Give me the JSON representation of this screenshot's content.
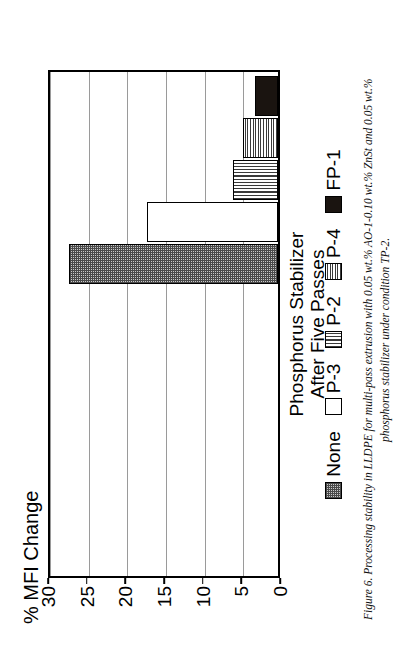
{
  "figure": {
    "caption_line1": "Figure 6.  Processing stability in  LLDPE  for  multi-pass extrusion  with  0.05  wt.%  AO-1-0.10  wt.%  ZnSt  and  0.05  wt.%",
    "caption_line2": "phosphorus stabilizer under condition TP-2."
  },
  "chart_data": {
    "type": "bar",
    "orientation": "vertical",
    "title": "",
    "xlabel": "Phosphorus Stabilizer After Five Passes",
    "ylabel": "% MFI Change",
    "categories": [
      "None",
      "P-3",
      "P-2",
      "P-4",
      "FP-1"
    ],
    "values": [
      27,
      17,
      5.8,
      4.5,
      3
    ],
    "ylim": [
      0,
      30
    ],
    "yticks": [
      0,
      5,
      10,
      15,
      20,
      25,
      30
    ],
    "ytick_labels": [
      "0",
      "5",
      "10",
      "15",
      "20",
      "25",
      "30"
    ],
    "grid": true,
    "grid_axis": "y",
    "legend_position": "bottom",
    "series": [
      {
        "name": "None",
        "value": 27,
        "pattern": "gray-checker",
        "swatch_class": "pat-checker"
      },
      {
        "name": "P-3",
        "value": 17,
        "pattern": "white-empty",
        "swatch_class": "pat-empty"
      },
      {
        "name": "P-2",
        "value": 5.8,
        "pattern": "vertical-lines",
        "swatch_class": "pat-vlines"
      },
      {
        "name": "P-4",
        "value": 4.5,
        "pattern": "fine-grid",
        "swatch_class": "pat-grid"
      },
      {
        "name": "FP-1",
        "value": 3,
        "pattern": "solid-black",
        "swatch_class": "pat-solid"
      }
    ]
  },
  "axis": {
    "x_title_line1": "Phosphorus Stabilizer",
    "x_title_line2": "After Five Passes",
    "y_title": "% MFI Change"
  },
  "colors": {
    "frame": "#000000",
    "gridline": "#9a9a9a",
    "solid_fill": "#1a1410",
    "checker_fill": "#c9c9c9",
    "background": "#ffffff"
  }
}
